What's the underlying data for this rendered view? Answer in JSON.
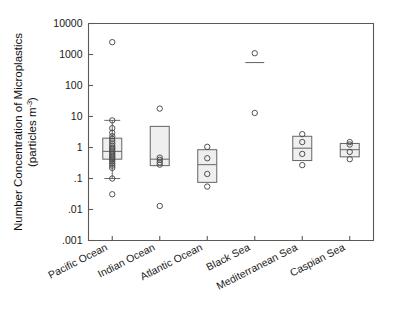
{
  "chart_data": {
    "type": "box",
    "title": "",
    "xlabel": "",
    "ylabel_line1": "Number Concentration of Microplastics",
    "ylabel_line2": "(particles m",
    "ylabel_exp": "-3",
    "ylabel_line2_end": ")",
    "yscale": "log",
    "ylim": [
      0.001,
      10000
    ],
    "ytick_labels": [
      "10000",
      "1000",
      "100",
      "10",
      "1",
      ".1",
      ".01",
      ".001"
    ],
    "ytick_values": [
      10000,
      1000,
      100,
      10,
      1,
      0.1,
      0.01,
      0.001
    ],
    "grid": false,
    "legend": "none",
    "categories": [
      "Pacific Ocean",
      "Indian Ocean",
      "Atlantic Ocean",
      "Black Sea",
      "Mediterranean Sea",
      "Caspian Sea"
    ],
    "boxes": [
      {
        "category": "Pacific Ocean",
        "q1": 0.42,
        "median": 0.75,
        "q3": 2.0,
        "whisker_low": 0.1,
        "whisker_high": 7.5,
        "points": [
          2500,
          7.5,
          4.2,
          3.0,
          2.3,
          1.9,
          1.6,
          1.35,
          1.15,
          1.0,
          0.9,
          0.8,
          0.7,
          0.62,
          0.55,
          0.5,
          0.45,
          0.4,
          0.35,
          0.3,
          0.26,
          0.22,
          0.1,
          0.031
        ]
      },
      {
        "category": "Indian Ocean",
        "q1": 0.26,
        "median": 0.42,
        "q3": 4.8,
        "whisker_low": null,
        "whisker_high": null,
        "points": [
          18,
          0.47,
          0.4,
          0.33,
          0.28,
          0.013
        ]
      },
      {
        "category": "Atlantic Ocean",
        "q1": 0.075,
        "median": 0.28,
        "q3": 0.85,
        "whisker_low": null,
        "whisker_high": null,
        "points": [
          1.05,
          0.45,
          0.14,
          0.055
        ]
      },
      {
        "category": "Black Sea",
        "q1": 550,
        "median": 550,
        "q3": 550,
        "whisker_low": null,
        "whisker_high": null,
        "points": [
          1100,
          13
        ]
      },
      {
        "category": "Mediterranean Sea",
        "q1": 0.38,
        "median": 0.95,
        "q3": 2.3,
        "whisker_low": null,
        "whisker_high": null,
        "points": [
          2.7,
          1.5,
          0.62,
          0.27
        ]
      },
      {
        "category": "Caspian Sea",
        "q1": 0.5,
        "median": 0.85,
        "q3": 1.35,
        "whisker_low": null,
        "whisker_high": null,
        "points": [
          1.5,
          1.25,
          0.72,
          0.42
        ]
      }
    ]
  }
}
